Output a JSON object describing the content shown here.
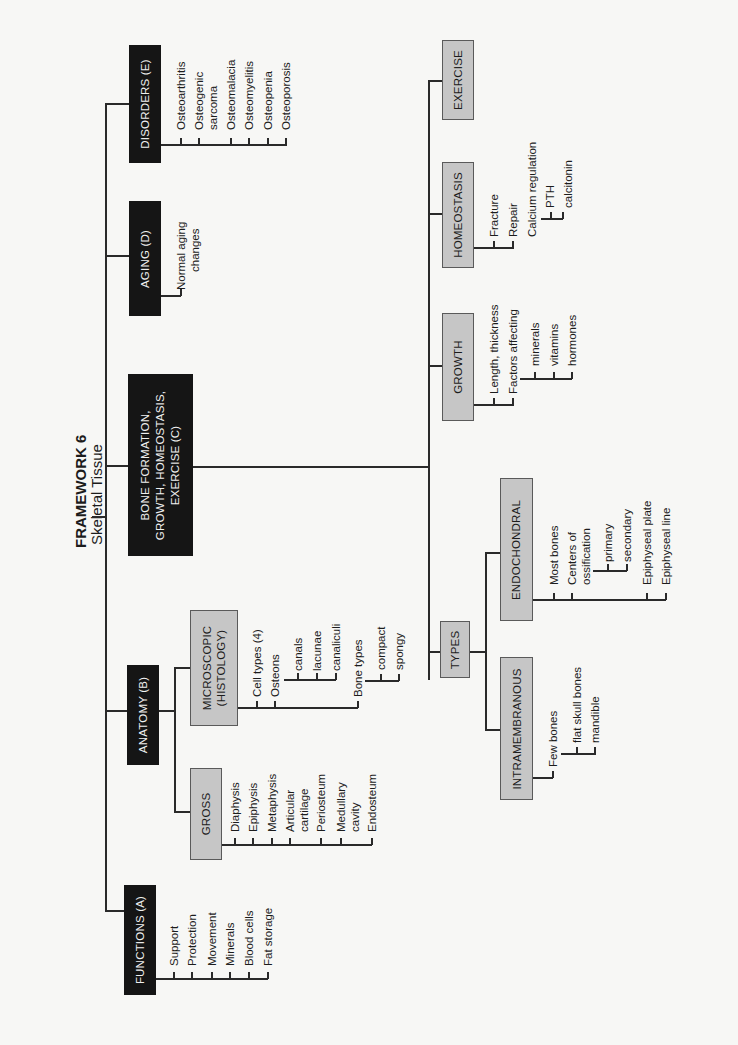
{
  "title": "FRAMEWORK 6",
  "subtitle": "Skeletal Tissue",
  "branches": {
    "functions": {
      "label": "FUNCTIONS (A)",
      "items": [
        "Support",
        "Protection",
        "Movement",
        "Minerals",
        "Blood cells",
        "Fat storage"
      ]
    },
    "anatomy": {
      "label": "ANATOMY (B)",
      "gross": {
        "label": "GROSS",
        "items": [
          "Diaphysis",
          "Epiphysis",
          "Metaphysis",
          "Articular",
          "cartilage",
          "Periosteum",
          "Medullary",
          "cavity",
          "Endosteum"
        ]
      },
      "microscopic": {
        "label_line1": "MICROSCOPIC",
        "label_line2": "(HISTOLOGY)",
        "items": [
          "Cell types (4)",
          "Osteons",
          "Bone types"
        ],
        "osteons_sub": [
          "canals",
          "lacunae",
          "canaliculi"
        ],
        "bone_types_sub": [
          "compact",
          "spongy"
        ]
      }
    },
    "bone_formation": {
      "label_line1": "BONE FORMATION,",
      "label_line2": "GROWTH, HOMEOSTASIS,",
      "label_line3": "EXERCISE (C)",
      "types": {
        "label": "TYPES",
        "intramembranous": {
          "label": "INTRAMEMBRANOUS",
          "items": [
            "Few bones"
          ],
          "sub": [
            "flat skull bones",
            "mandible"
          ]
        },
        "endochondral": {
          "label": "ENDOCHONDRAL",
          "items": [
            "Most bones",
            "Centers of",
            "ossification",
            "Epiphyseal plate",
            "Epiphyseal line"
          ],
          "sub": [
            "primary",
            "secondary"
          ]
        }
      },
      "growth": {
        "label": "GROWTH",
        "items": [
          "Length, thickness",
          "Factors affecting"
        ],
        "sub": [
          "minerals",
          "vitamins",
          "hormones"
        ]
      },
      "homeostasis": {
        "label": "HOMEOSTASIS",
        "items": [
          "Fracture",
          "Repair",
          "Calcium regulation"
        ],
        "sub": [
          "PTH",
          "calcitonin"
        ]
      },
      "exercise": {
        "label": "EXERCISE"
      }
    },
    "aging": {
      "label": "AGING (D)",
      "items": [
        "Normal aging",
        "changes"
      ]
    },
    "disorders": {
      "label": "DISORDERS (E)",
      "items": [
        "Osteoarthritis",
        "Osteogenic",
        "sarcoma",
        "Osteomalacia",
        "Osteomyelitis",
        "Osteopenia",
        "Osteoporosis"
      ]
    }
  }
}
